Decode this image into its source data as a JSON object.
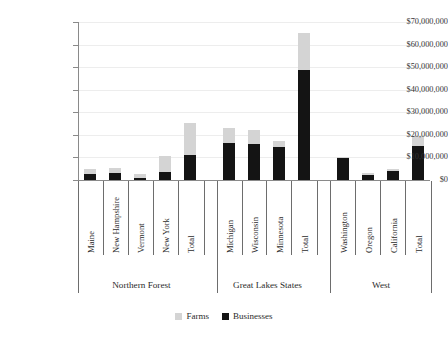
{
  "chart_data": {
    "type": "bar",
    "subtype": "stacked-bar-grouped",
    "title": "",
    "xlabel": "",
    "ylabel": "",
    "ylim": [
      0,
      70000000
    ],
    "ytick_labels": [
      "$70,000,000",
      "$60,000,000",
      "$50,000,000",
      "$40,000,000",
      "$30,000,000",
      "$20,000,000",
      "$10,000,000",
      "$0"
    ],
    "ytick_values": [
      70000000,
      60000000,
      50000000,
      40000000,
      30000000,
      20000000,
      10000000,
      0
    ],
    "grid": true,
    "legend_position": "bottom-center",
    "series": [
      {
        "name": "Farms",
        "color": "#d4d4d4"
      },
      {
        "name": "Businesses",
        "color": "#141414"
      }
    ],
    "groups": [
      {
        "label": "Northern Forest",
        "categories": [
          {
            "label": "Maine",
            "businesses": 2800000,
            "farms": 2200000
          },
          {
            "label": "New Hampshire",
            "businesses": 3200000,
            "farms": 2000000
          },
          {
            "label": "Vermont",
            "businesses": 1000000,
            "farms": 1700000
          },
          {
            "label": "New York",
            "businesses": 3400000,
            "farms": 7400000
          },
          {
            "label": "Total",
            "businesses": 11000000,
            "farms": 14200000
          }
        ]
      },
      {
        "label": "Great Lakes States",
        "categories": [
          {
            "label": "Michigan",
            "businesses": 16200000,
            "farms": 6800000
          },
          {
            "label": "Wisconsin",
            "businesses": 16100000,
            "farms": 5900000
          },
          {
            "label": "Minnesota",
            "businesses": 14600000,
            "farms": 2500000
          },
          {
            "label": "Total",
            "businesses": 48800000,
            "farms": 16200000
          }
        ]
      },
      {
        "label": "West",
        "categories": [
          {
            "label": "Washington",
            "businesses": 9900000,
            "farms": 500000
          },
          {
            "label": "Oregon",
            "businesses": 2100000,
            "farms": 1000000
          },
          {
            "label": "California",
            "businesses": 3800000,
            "farms": 1300000
          },
          {
            "label": "Total",
            "businesses": 15200000,
            "farms": 4300000
          }
        ]
      }
    ]
  }
}
